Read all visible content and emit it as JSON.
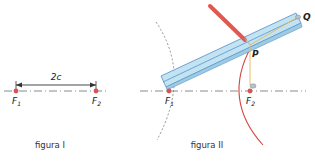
{
  "figure1": {
    "caption": "figura I",
    "distance_label": "2c",
    "focus1": {
      "name": "F",
      "sub": "1"
    },
    "focus2": {
      "name": "F",
      "sub": "2"
    }
  },
  "figure2": {
    "caption": "figura II",
    "focus1": {
      "name": "F",
      "sub": "1"
    },
    "focus2": {
      "name": "F",
      "sub": "2"
    },
    "point_p": "P",
    "point_q": "Q"
  },
  "colors": {
    "focus": "#d9534f",
    "axis": "#8a8a8a",
    "ruler_fill": "#bfe3f2",
    "ruler_stroke": "#4a86c5",
    "pencil": "#e0584f",
    "string": "#e6b85c",
    "curve": "#d6463e"
  }
}
